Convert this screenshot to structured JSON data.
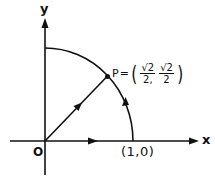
{
  "diagram": {
    "x_axis_label": "x",
    "y_axis_label": "y",
    "origin_label": "O",
    "point_on_x_axis_label": "(1,0)",
    "point_p": {
      "name": "P",
      "equals": "=",
      "x_numerator": "√2",
      "x_denominator": "2,",
      "y_numerator": "√2",
      "y_denominator": "2",
      "open_paren": "(",
      "close_paren": ")"
    },
    "elements": [
      "x-axis",
      "y-axis",
      "quarter-circle-arc",
      "radius-vector-to-P",
      "arrow-on-x-axis",
      "arrow-on-arc",
      "arrow-on-radius"
    ],
    "colors": {
      "stroke": "#111111",
      "background": "#ffffff"
    }
  }
}
